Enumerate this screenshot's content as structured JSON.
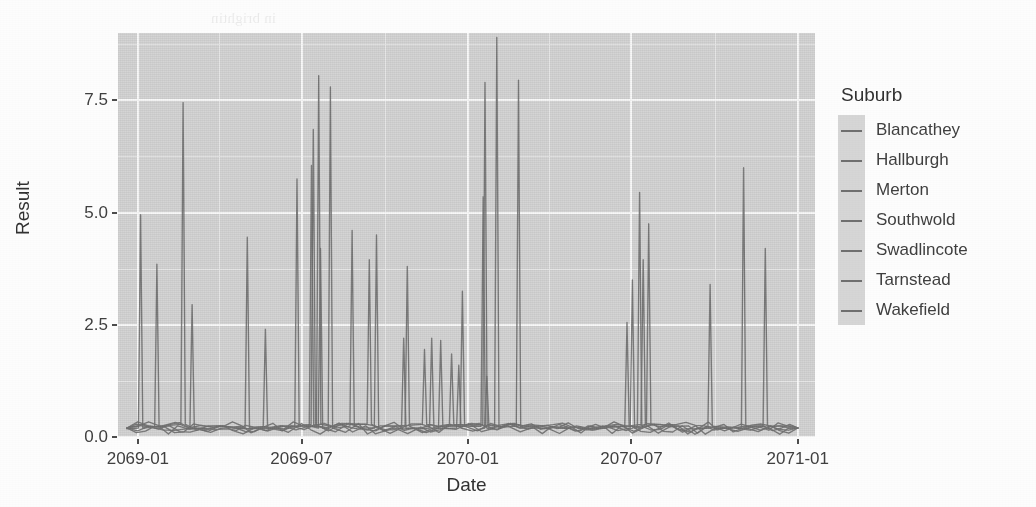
{
  "chart_data": {
    "type": "line",
    "title": "",
    "subtitle": "",
    "xlabel": "Date",
    "ylabel": "Result",
    "grid": true,
    "legend_position": "right",
    "legend_title": "Suburb",
    "x_type": "date",
    "xlim": [
      "2068-12-10",
      "2071-01-20"
    ],
    "ylim": [
      0,
      9.0
    ],
    "y_ticks": [
      "0.0",
      "2.5",
      "5.0",
      "7.5"
    ],
    "y_tick_values": [
      0.0,
      2.5,
      5.0,
      7.5
    ],
    "y_minor_ticks": [
      1.25,
      3.75,
      6.25,
      8.75
    ],
    "x_ticks": [
      "2069-01",
      "2069-07",
      "2070-01",
      "2070-07",
      "2071-01"
    ],
    "x_tick_values": [
      "2069-01-01",
      "2069-07-01",
      "2070-01-01",
      "2070-07-01",
      "2071-01-01"
    ],
    "x_minor_ticks": [
      "2069-04-01",
      "2069-10-01",
      "2070-04-01",
      "2070-10-01"
    ],
    "series": [
      {
        "name": "Blancathey",
        "color": "#6e6e6e",
        "x": [
          "2068-12-20",
          "2069-01-04",
          "2069-01-16",
          "2069-02-10",
          "2069-03-05",
          "2069-04-02",
          "2069-05-01",
          "2069-06-02",
          "2069-07-01",
          "2069-08-01",
          "2069-09-01",
          "2069-10-01",
          "2069-11-01",
          "2069-12-01",
          "2070-01-05",
          "2070-02-01",
          "2070-03-01",
          "2070-04-01",
          "2070-05-05",
          "2070-06-01",
          "2070-07-01",
          "2070-08-01",
          "2070-09-01",
          "2070-10-01",
          "2070-11-01",
          "2070-12-01",
          "2071-01-01"
        ],
        "y": [
          0.18,
          4.95,
          0.22,
          0.15,
          0.2,
          0.25,
          0.18,
          0.22,
          0.3,
          0.2,
          0.18,
          0.25,
          0.2,
          0.22,
          0.3,
          0.25,
          0.2,
          0.18,
          0.22,
          0.2,
          0.25,
          0.2,
          0.18,
          0.22,
          0.2,
          0.25,
          0.2
        ]
      },
      {
        "name": "Hallburgh",
        "color": "#6e6e6e",
        "x": [
          "2068-12-20",
          "2069-01-22",
          "2069-02-14",
          "2069-03-12",
          "2069-04-10",
          "2069-05-10",
          "2069-06-10",
          "2069-07-12",
          "2069-08-12",
          "2069-09-10",
          "2069-10-12",
          "2069-11-10",
          "2069-12-12",
          "2070-01-18",
          "2070-02-15",
          "2070-03-12",
          "2070-04-10",
          "2070-05-12",
          "2070-06-12",
          "2070-07-10",
          "2070-08-12",
          "2070-09-10",
          "2070-10-12",
          "2070-11-10",
          "2070-12-12",
          "2071-01-01"
        ],
        "y": [
          0.2,
          3.85,
          0.25,
          0.2,
          0.18,
          0.22,
          0.25,
          6.05,
          0.3,
          0.25,
          0.2,
          0.22,
          0.25,
          5.35,
          0.3,
          0.25,
          0.22,
          0.2,
          0.25,
          5.45,
          0.28,
          0.25,
          0.2,
          0.22,
          0.25,
          0.2
        ]
      },
      {
        "name": "Merton",
        "color": "#6e6e6e",
        "x": [
          "2068-12-20",
          "2069-02-20",
          "2069-03-20",
          "2069-04-20",
          "2069-05-20",
          "2069-06-20",
          "2069-07-20",
          "2069-08-20",
          "2069-09-20",
          "2069-10-20",
          "2069-11-20",
          "2069-12-20",
          "2070-01-20",
          "2070-02-20",
          "2070-03-20",
          "2070-04-20",
          "2070-05-20",
          "2070-06-20",
          "2070-07-20",
          "2070-08-20",
          "2070-09-20",
          "2070-10-20",
          "2070-11-20",
          "2070-12-20",
          "2071-01-01"
        ],
        "y": [
          0.2,
          7.45,
          0.25,
          0.2,
          0.22,
          0.25,
          8.05,
          0.3,
          0.25,
          0.2,
          0.22,
          0.25,
          7.9,
          0.3,
          0.25,
          0.22,
          0.2,
          0.25,
          4.75,
          0.28,
          0.25,
          0.2,
          0.22,
          0.25,
          0.2
        ]
      },
      {
        "name": "Southwold",
        "color": "#6e6e6e",
        "x": [
          "2068-12-20",
          "2069-03-02",
          "2069-04-02",
          "2069-05-02",
          "2069-06-02",
          "2069-07-02",
          "2069-08-02",
          "2069-09-02",
          "2069-10-02",
          "2069-11-02",
          "2069-12-02",
          "2070-01-02",
          "2070-02-02",
          "2070-03-02",
          "2070-04-02",
          "2070-05-02",
          "2070-06-02",
          "2070-07-02",
          "2070-08-02",
          "2070-09-02",
          "2070-10-02",
          "2070-11-02",
          "2070-12-02",
          "2071-01-01"
        ],
        "y": [
          0.2,
          2.95,
          0.25,
          4.45,
          0.2,
          0.25,
          7.8,
          0.3,
          0.25,
          0.2,
          2.15,
          0.3,
          8.9,
          0.25,
          0.22,
          0.2,
          0.25,
          3.5,
          0.28,
          0.25,
          0.2,
          6.0,
          0.25,
          0.2
        ]
      },
      {
        "name": "Swadlincote",
        "color": "#6e6e6e",
        "x": [
          "2068-12-20",
          "2069-01-28",
          "2069-02-26",
          "2069-03-26",
          "2069-04-26",
          "2069-05-26",
          "2069-06-26",
          "2069-07-26",
          "2069-08-26",
          "2069-09-26",
          "2069-10-26",
          "2069-11-26",
          "2069-12-26",
          "2070-01-26",
          "2070-02-26",
          "2070-03-26",
          "2070-04-26",
          "2070-05-26",
          "2070-06-26",
          "2070-07-26",
          "2070-08-26",
          "2070-09-26",
          "2070-10-26",
          "2070-11-26",
          "2070-12-26",
          "2071-01-01"
        ],
        "y": [
          0.2,
          0.25,
          0.2,
          0.22,
          0.25,
          0.2,
          5.75,
          0.3,
          4.6,
          0.25,
          3.8,
          0.22,
          3.25,
          0.3,
          7.95,
          0.25,
          0.22,
          0.2,
          2.55,
          0.28,
          0.25,
          3.4,
          0.2,
          4.2,
          0.25,
          0.2
        ]
      },
      {
        "name": "Tarnstead",
        "color": "#6e6e6e",
        "x": [
          "2068-12-20",
          "2069-02-05",
          "2069-04-14",
          "2069-05-14",
          "2069-06-14",
          "2069-07-14",
          "2069-08-14",
          "2069-09-14",
          "2069-10-14",
          "2069-11-14",
          "2069-12-14",
          "2070-01-14",
          "2070-02-14",
          "2070-03-14",
          "2070-04-14",
          "2070-05-14",
          "2070-06-14",
          "2070-07-14",
          "2070-08-14",
          "2070-09-14",
          "2070-10-14",
          "2070-11-14",
          "2070-12-14",
          "2071-01-01"
        ],
        "y": [
          0.2,
          0.25,
          0.22,
          0.2,
          0.25,
          6.85,
          0.3,
          3.95,
          0.25,
          1.95,
          1.85,
          0.3,
          0.25,
          0.22,
          0.2,
          0.25,
          0.28,
          3.95,
          0.25,
          0.2,
          0.22,
          0.25,
          0.2,
          0.2
        ]
      },
      {
        "name": "Wakefield",
        "color": "#6e6e6e",
        "x": [
          "2068-12-20",
          "2069-03-14",
          "2069-05-22",
          "2069-06-22",
          "2069-07-22",
          "2069-08-22",
          "2069-09-22",
          "2069-10-22",
          "2069-11-22",
          "2069-12-22",
          "2070-01-22",
          "2070-02-22",
          "2070-03-22",
          "2070-04-22",
          "2070-05-22",
          "2070-06-22",
          "2070-07-22",
          "2070-08-22",
          "2070-09-22",
          "2070-10-22",
          "2070-11-22",
          "2070-12-22",
          "2071-01-01"
        ],
        "y": [
          0.2,
          0.25,
          2.4,
          0.22,
          4.2,
          0.3,
          4.5,
          2.2,
          2.2,
          1.6,
          1.35,
          0.3,
          0.25,
          0.22,
          0.2,
          0.25,
          0.28,
          0.25,
          0.2,
          0.22,
          0.25,
          0.2,
          0.2
        ]
      }
    ],
    "peaks": [
      {
        "date": "2069-01-04",
        "value": 4.95
      },
      {
        "date": "2069-01-22",
        "value": 3.85
      },
      {
        "date": "2069-02-20",
        "value": 7.45
      },
      {
        "date": "2069-03-02",
        "value": 2.95
      },
      {
        "date": "2069-05-02",
        "value": 4.45
      },
      {
        "date": "2069-06-26",
        "value": 5.75
      },
      {
        "date": "2069-07-12",
        "value": 6.05
      },
      {
        "date": "2069-07-14",
        "value": 6.85
      },
      {
        "date": "2069-07-20",
        "value": 8.05
      },
      {
        "date": "2069-07-22",
        "value": 4.2
      },
      {
        "date": "2069-08-02",
        "value": 7.8
      },
      {
        "date": "2069-08-14",
        "value": 3.95
      },
      {
        "date": "2069-08-26",
        "value": 4.6
      },
      {
        "date": "2069-09-22",
        "value": 4.5
      },
      {
        "date": "2069-10-26",
        "value": 3.8
      },
      {
        "date": "2069-12-02",
        "value": 2.15
      },
      {
        "date": "2069-12-26",
        "value": 3.25
      },
      {
        "date": "2070-01-18",
        "value": 5.35
      },
      {
        "date": "2070-01-20",
        "value": 7.9
      },
      {
        "date": "2070-02-02",
        "value": 8.9
      },
      {
        "date": "2070-02-26",
        "value": 7.95
      },
      {
        "date": "2070-06-26",
        "value": 2.55
      },
      {
        "date": "2070-07-10",
        "value": 5.45
      },
      {
        "date": "2070-07-02",
        "value": 3.5
      },
      {
        "date": "2070-07-14",
        "value": 3.95
      },
      {
        "date": "2070-07-20",
        "value": 4.75
      },
      {
        "date": "2070-09-26",
        "value": 3.4
      },
      {
        "date": "2070-11-02",
        "value": 6.0
      },
      {
        "date": "2070-11-26",
        "value": 4.2
      }
    ],
    "baseline_level": 0.2
  },
  "axes": {
    "y_title": "Result",
    "x_title": "Date",
    "y_tick_labels": [
      "0.0",
      "2.5",
      "5.0",
      "7.5"
    ],
    "x_tick_labels": [
      "2069-01",
      "2069-07",
      "2070-01",
      "2070-07",
      "2071-01"
    ]
  },
  "legend": {
    "title": "Suburb",
    "items": [
      {
        "label": "Blancathey"
      },
      {
        "label": "Hallburgh"
      },
      {
        "label": "Merton"
      },
      {
        "label": "Southwold"
      },
      {
        "label": "Swadlincote"
      },
      {
        "label": "Tarnstead"
      },
      {
        "label": "Wakefield"
      }
    ]
  },
  "theme": {
    "panel_background": "#d3d3d3",
    "page_background": "#fdfdfd",
    "major_gridline": "#fafafa",
    "minor_gridline": "#e8e8e8",
    "line_color": "#6e6e6e",
    "text_color": "#3d3d3d"
  },
  "bleed_through": {
    "lines": [
      "in brightin",
      "a reading",
      "s ent of",
      "ut ro es",
      "eir tie c",
      "to the",
      "a is of",
      "rn ve the",
      "ection the"
    ]
  }
}
